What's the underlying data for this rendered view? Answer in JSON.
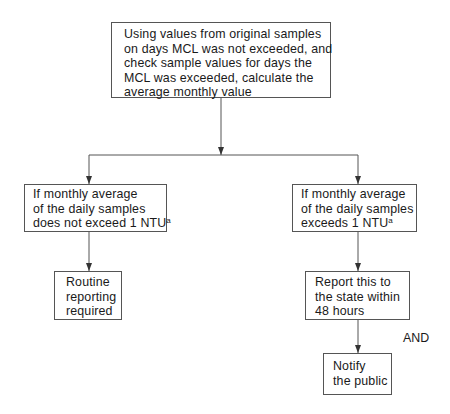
{
  "diagram": {
    "nodes": {
      "start": {
        "lines": [
          "Using values from original samples",
          "on days MCL was not exceeded, and",
          "check sample values for days the",
          "MCL was exceeded, calculate the",
          "average monthly value"
        ]
      },
      "not_exceed": {
        "lines": [
          "If monthly average",
          "of the daily samples",
          "does not exceed 1 NTU"
        ],
        "footnote": "a"
      },
      "exceed": {
        "lines": [
          "If monthly average",
          "of the daily samples",
          "exceeds 1 NTU"
        ],
        "footnote": "a"
      },
      "routine": {
        "lines": [
          "Routine",
          "reporting",
          "required"
        ]
      },
      "report_state": {
        "lines": [
          "Report this to",
          "the state within",
          "48 hours"
        ]
      },
      "notify": {
        "lines": [
          "Notify",
          "the public"
        ]
      }
    },
    "connector_label": "AND",
    "edges": [
      {
        "from": "start",
        "to": "not_exceed"
      },
      {
        "from": "start",
        "to": "exceed"
      },
      {
        "from": "not_exceed",
        "to": "routine"
      },
      {
        "from": "exceed",
        "to": "report_state"
      },
      {
        "from": "report_state",
        "to": "notify",
        "label": "AND"
      }
    ],
    "colors": {
      "line": "#555555",
      "text": "#1a1a1a",
      "background": "#ffffff"
    }
  }
}
